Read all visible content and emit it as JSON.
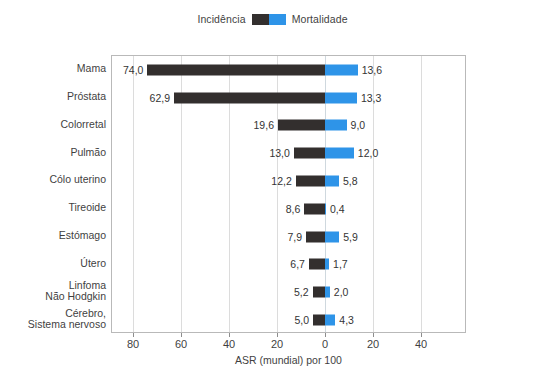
{
  "legend": {
    "incidence_label": "Incidência",
    "mortality_label": "Mortalidade",
    "incidence_swatch_name": "incidence-color-swatch",
    "mortality_swatch_name": "mortality-color-swatch",
    "incidence_color": "#332f2e",
    "mortality_color": "#2e94e8"
  },
  "axis": {
    "x_title": "ASR (mundial) por 100",
    "x_ticklabels": [
      "80",
      "60",
      "40",
      "20",
      "0",
      "20",
      "40"
    ]
  },
  "caption": {
    "text": ""
  },
  "chart_data": {
    "type": "bar",
    "orientation": "horizontal",
    "subtype": "diverging-bidirectional-population-pyramid",
    "title": "",
    "subtitle": "",
    "xlabel": "ASR (mundial) por 100",
    "ylabel": "",
    "grid": true,
    "legend_position": "top-center",
    "x_tick_values": [
      -80,
      -60,
      -40,
      -20,
      0,
      20,
      40
    ],
    "x_ticklabels": [
      "80",
      "60",
      "40",
      "20",
      "0",
      "20",
      "40"
    ],
    "xlim": [
      -88.5,
      59.2
    ],
    "zero_at_px": 213,
    "units_per_px": 0.4167,
    "categories": [
      "Mama",
      "Próstata",
      "Colorretal",
      "Pulmão",
      "Cólo uterino",
      "Tireoide",
      "Estómago",
      "Útero",
      "Linfoma\nNão Hodgkin",
      "Cérebro,\nSistema nervoso"
    ],
    "series": [
      {
        "name": "Incidência",
        "color": "#332f2e",
        "direction": "left",
        "values": [
          74.0,
          62.9,
          19.6,
          13.0,
          12.2,
          8.6,
          7.9,
          6.7,
          5.2,
          5.0
        ],
        "labels": [
          "74,0",
          "62,9",
          "19,6",
          "13,0",
          "12,2",
          "8,6",
          "7,9",
          "6,7",
          "5,2",
          "5,0"
        ]
      },
      {
        "name": "Mortalidade",
        "color": "#2e94e8",
        "direction": "right",
        "values": [
          13.6,
          13.3,
          9.0,
          12.0,
          5.8,
          0.4,
          5.9,
          1.7,
          2.0,
          4.3
        ],
        "labels": [
          "13,6",
          "13,3",
          "9,0",
          "12,0",
          "5,8",
          "0,4",
          "5,9",
          "1,7",
          "2,0",
          "4,3"
        ]
      }
    ]
  }
}
